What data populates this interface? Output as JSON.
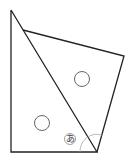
{
  "diagram": {
    "type": "geometry-figure",
    "stroke_color": "#222222",
    "blank_color": "#555555",
    "angle_arc_color": "#999999",
    "angle_label": "あ",
    "shapes": {
      "triangle": [
        [
          11,
          10
        ],
        [
          11,
          152
        ],
        [
          97,
          152
        ]
      ],
      "quadrilateral": [
        [
          23,
          30
        ],
        [
          124,
          56
        ],
        [
          97,
          152
        ]
      ],
      "blanks": [
        {
          "cx": 82,
          "cy": 79,
          "r": 7.5
        },
        {
          "cx": 42,
          "cy": 123,
          "r": 7.5
        }
      ]
    }
  }
}
